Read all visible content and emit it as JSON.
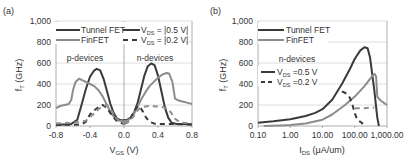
{
  "chart_data": [
    {
      "type": "line",
      "panel_label": "(a)",
      "xlabel": "V_GS (V)",
      "xlabel_main": "V",
      "xlabel_sub": "GS",
      "xlabel_unit": " (V)",
      "ylabel": "f_T (GHz)",
      "ylabel_main": "f",
      "ylabel_sub": "T",
      "ylabel_unit": " (GHz)",
      "xlim": [
        -0.8,
        0.8
      ],
      "ylim": [
        0,
        1000
      ],
      "x_ticks": [
        "-0.8",
        "-0.4",
        "0.0",
        "0.4",
        "0.8"
      ],
      "x_tick_values": [
        -0.8,
        -0.4,
        0.0,
        0.4,
        0.8
      ],
      "y_ticks": [
        "0",
        "200",
        "400",
        "600",
        "800",
        "1,000"
      ],
      "y_tick_values": [
        0,
        200,
        400,
        600,
        800,
        1000
      ],
      "grid": true,
      "annotations": [
        "p-devices",
        "n-devices"
      ],
      "legend": {
        "placement": "top",
        "entries": [
          {
            "label": "Tunnel FET",
            "style": "solid",
            "color": "#3a3a3a"
          },
          {
            "label": "FinFET",
            "style": "solid",
            "color": "#8c8c8c"
          },
          {
            "label": "V_DS = |0.5 V|",
            "main": "V",
            "sub": "DS",
            "rest": " = |0.5 V|",
            "style": "solid",
            "color": "#3a3a3a"
          },
          {
            "label": "V_DS = |0.2 V|",
            "main": "V",
            "sub": "DS",
            "rest": " = |0.2 V|",
            "style": "dashed",
            "color": "#3a3a3a"
          }
        ]
      },
      "series": [
        {
          "name": "Tunnel FET V_DS=0.5V (p)",
          "color": "#3a3a3a",
          "dash": false,
          "x": [
            -0.8,
            -0.7,
            -0.62,
            -0.55,
            -0.5,
            -0.45,
            -0.4,
            -0.35,
            -0.32,
            -0.28,
            -0.24,
            -0.2,
            -0.16,
            -0.12,
            -0.08,
            -0.04,
            0.0
          ],
          "y": [
            15,
            15,
            20,
            60,
            200,
            350,
            470,
            530,
            545,
            530,
            450,
            330,
            210,
            120,
            70,
            55,
            55
          ]
        },
        {
          "name": "Tunnel FET V_DS=0.5V (n)",
          "color": "#3a3a3a",
          "dash": false,
          "x": [
            0.0,
            0.04,
            0.08,
            0.12,
            0.16,
            0.2,
            0.24,
            0.28,
            0.32,
            0.36,
            0.4,
            0.44,
            0.48,
            0.52,
            0.56,
            0.62,
            0.7,
            0.8
          ],
          "y": [
            55,
            60,
            80,
            130,
            220,
            350,
            480,
            570,
            595,
            580,
            480,
            330,
            180,
            80,
            30,
            20,
            18,
            15
          ]
        },
        {
          "name": "FinFET V_DS=0.5V (p)",
          "color": "#8c8c8c",
          "dash": false,
          "x": [
            -0.8,
            -0.75,
            -0.7,
            -0.65,
            -0.62,
            -0.6,
            -0.57,
            -0.53,
            -0.5,
            -0.45,
            -0.4,
            -0.35,
            -0.3,
            -0.25,
            -0.2,
            -0.15,
            -0.1,
            -0.05,
            0.0
          ],
          "y": [
            170,
            190,
            200,
            210,
            250,
            340,
            420,
            450,
            440,
            420,
            400,
            380,
            340,
            280,
            200,
            120,
            70,
            50,
            45
          ]
        },
        {
          "name": "FinFET V_DS=0.5V (n)",
          "color": "#8c8c8c",
          "dash": false,
          "x": [
            0.0,
            0.05,
            0.1,
            0.15,
            0.2,
            0.25,
            0.3,
            0.35,
            0.4,
            0.45,
            0.5,
            0.53,
            0.57,
            0.6,
            0.65,
            0.7,
            0.75,
            0.8
          ],
          "y": [
            45,
            55,
            90,
            170,
            250,
            320,
            380,
            420,
            460,
            490,
            505,
            500,
            420,
            260,
            240,
            230,
            220,
            210
          ]
        },
        {
          "name": "Tunnel FET V_DS=0.2V (p)",
          "color": "#3a3a3a",
          "dash": true,
          "x": [
            -0.8,
            -0.6,
            -0.5,
            -0.45,
            -0.42,
            -0.4,
            -0.35,
            -0.3,
            -0.25,
            -0.2,
            -0.15,
            -0.1,
            -0.05,
            0.0
          ],
          "y": [
            10,
            12,
            15,
            40,
            80,
            110,
            150,
            180,
            200,
            170,
            110,
            60,
            30,
            20
          ]
        },
        {
          "name": "Tunnel FET V_DS=0.2V (n)",
          "color": "#3a3a3a",
          "dash": true,
          "x": [
            0.0,
            0.05,
            0.1,
            0.15,
            0.18,
            0.22,
            0.26,
            0.3,
            0.35,
            0.4,
            0.5,
            0.6,
            0.8
          ],
          "y": [
            20,
            40,
            110,
            180,
            190,
            140,
            80,
            40,
            25,
            20,
            20,
            18,
            15
          ]
        },
        {
          "name": "FinFET V_DS=0.2V (p)",
          "color": "#8c8c8c",
          "dash": true,
          "x": [
            -0.8,
            -0.6,
            -0.45,
            -0.35,
            -0.3,
            -0.25,
            -0.2,
            -0.15,
            -0.1,
            -0.05,
            0.0
          ],
          "y": [
            25,
            30,
            50,
            120,
            160,
            190,
            200,
            150,
            80,
            40,
            25
          ]
        },
        {
          "name": "FinFET V_DS=0.2V (n)",
          "color": "#8c8c8c",
          "dash": true,
          "x": [
            0.0,
            0.05,
            0.1,
            0.15,
            0.2,
            0.3,
            0.4,
            0.45,
            0.5,
            0.55,
            0.6,
            0.65,
            0.7,
            0.8
          ],
          "y": [
            25,
            40,
            80,
            140,
            180,
            190,
            185,
            180,
            170,
            130,
            70,
            40,
            30,
            25
          ]
        }
      ]
    },
    {
      "type": "line",
      "panel_label": "(b)",
      "xlabel": "I_DS (μA/um)",
      "xlabel_main": "I",
      "xlabel_sub": "DS",
      "xlabel_unit": " (μA/um)",
      "ylabel": "f_T (GHz)",
      "ylabel_main": "f",
      "ylabel_sub": "T",
      "ylabel_unit": " (GHz)",
      "xscale": "log",
      "xlim": [
        0.1,
        1000
      ],
      "ylim": [
        0,
        1000
      ],
      "x_ticks": [
        "0.10",
        "1.00",
        "10.00",
        "100.00",
        "1,000.00"
      ],
      "x_tick_values": [
        0.1,
        1,
        10,
        100,
        1000
      ],
      "y_ticks": [
        "0",
        "200",
        "400",
        "600",
        "800",
        "1,000"
      ],
      "y_tick_values": [
        0,
        200,
        400,
        600,
        800,
        1000
      ],
      "grid": true,
      "annotations": [
        "n-devices"
      ],
      "legend": {
        "placement": "top-left",
        "entries": [
          {
            "label": "Tunnel FET",
            "style": "solid",
            "color": "#3a3a3a"
          },
          {
            "label": "FinFET",
            "style": "solid",
            "color": "#8c8c8c"
          },
          {
            "label": "V_DS =0.5 V",
            "main": "V",
            "sub": "DS",
            "rest": " =0.5 V",
            "style": "solid",
            "color": "#3a3a3a"
          },
          {
            "label": "V_DS =0.2 V",
            "main": "V",
            "sub": "DS",
            "rest": " =0.2 V",
            "style": "dashed",
            "color": "#3a3a3a"
          }
        ]
      },
      "series": [
        {
          "name": "Tunnel FET V_DS=0.5V",
          "color": "#3a3a3a",
          "dash": false,
          "x": [
            0.1,
            0.3,
            1,
            3,
            6,
            10,
            20,
            40,
            70,
            100,
            150,
            200,
            250,
            300,
            400,
            500,
            560
          ],
          "y": [
            30,
            45,
            65,
            95,
            125,
            160,
            250,
            400,
            540,
            640,
            720,
            750,
            740,
            650,
            350,
            80,
            0
          ]
        },
        {
          "name": "FinFET V_DS=0.5V",
          "color": "#8c8c8c",
          "dash": false,
          "x": [
            0.15,
            0.5,
            1,
            3,
            10,
            20,
            50,
            100,
            200,
            300,
            380,
            420,
            460,
            500,
            560,
            650,
            800,
            1000
          ],
          "y": [
            0,
            5,
            10,
            25,
            60,
            110,
            200,
            280,
            380,
            450,
            490,
            495,
            470,
            280,
            260,
            240,
            220,
            200
          ]
        },
        {
          "name": "Tunnel FET V_DS=0.2V",
          "color": "#3a3a3a",
          "dash": true,
          "x": [
            40,
            55,
            70,
            85,
            100,
            120,
            150,
            180
          ],
          "y": [
            330,
            310,
            270,
            200,
            120,
            60,
            40,
            20
          ]
        },
        {
          "name": "FinFET V_DS=0.2V",
          "color": "#8c8c8c",
          "dash": true,
          "x": [
            100,
            150,
            200,
            300,
            400
          ],
          "y": [
            170,
            170,
            170,
            175,
            175
          ]
        }
      ]
    }
  ]
}
